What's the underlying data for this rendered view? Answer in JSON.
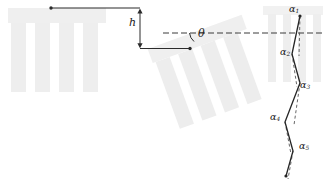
{
  "figure": {
    "width": 324,
    "height": 187,
    "background": "#ffffff",
    "colors": {
      "comb_fill": "#eeeeee",
      "comb_fill_light": "#f3f3f3",
      "line": "#2b2b2b",
      "dash": "#3a3a3a",
      "zigzag": "#262626",
      "label": "#1a1a1a"
    }
  },
  "labels": {
    "height": {
      "text": "h",
      "x": 131,
      "y": 23
    },
    "angle": {
      "text": "θ",
      "x": 198,
      "y": 34
    },
    "segments": [
      {
        "base": "α",
        "sub": "1",
        "x": 292,
        "y": 9
      },
      {
        "base": "α",
        "sub": "2",
        "x": 283,
        "y": 52
      },
      {
        "base": "α",
        "sub": "3",
        "x": 301,
        "y": 87
      },
      {
        "base": "α",
        "sub": "4",
        "x": 274,
        "y": 117
      },
      {
        "base": "α",
        "sub": "5",
        "x": 300,
        "y": 143
      }
    ]
  },
  "geometry": {
    "upright_comb": {
      "name": "upright-comb",
      "bar": {
        "x": 8,
        "y": 8,
        "w": 98,
        "h": 15
      },
      "teeth_top": 23,
      "teeth_bottom": 92,
      "teeth": [
        {
          "x": 11,
          "w": 15
        },
        {
          "x": 35,
          "w": 15
        },
        {
          "x": 59,
          "w": 15
        },
        {
          "x": 83,
          "w": 15
        }
      ]
    },
    "tilted_comb": {
      "name": "tilted-comb",
      "rotation_deg": -20,
      "pivot_x": 190,
      "pivot_y": 48,
      "bar": {
        "x": -40,
        "y": -14,
        "w": 100,
        "h": 15
      },
      "teeth_top": 1,
      "teeth_bottom": 72,
      "teeth": [
        {
          "x": -37,
          "w": 15
        },
        {
          "x": -13,
          "w": 15
        },
        {
          "x": 11,
          "w": 15
        },
        {
          "x": 35,
          "w": 15
        }
      ]
    },
    "dimension_h": {
      "name": "height-dimension",
      "top_rule": {
        "x1": 51,
        "y1": 8,
        "x2": 140,
        "y2": 8
      },
      "bottom_rule": {
        "x1": 140,
        "y1": 48.5,
        "x2": 190,
        "y2": 48.5
      },
      "arrow_x": 140,
      "arrow_top_y": 10,
      "arrow_bottom_y": 47,
      "dot": {
        "x": 51,
        "y": 8,
        "r": 1.7
      }
    },
    "angle_marker": {
      "name": "angle-theta",
      "dashed_ref": {
        "x1": 163,
        "y1": 33,
        "x2": 324,
        "y2": 33
      },
      "baseline": {
        "x1": 140,
        "y1": 48.5,
        "x2": 190,
        "y2": 48.5
      },
      "vertex": {
        "x": 190,
        "y": 48.5,
        "r": 1.7
      },
      "arc": "M 193 40 A 12 12 0 0 1 188 33"
    },
    "zigzag": {
      "name": "zigzag-polyline",
      "points": [
        [
          300,
          16
        ],
        [
          292,
          54
        ],
        [
          300,
          83
        ],
        [
          285,
          122
        ],
        [
          293,
          151
        ],
        [
          286,
          176
        ]
      ],
      "reference_dashes": [
        {
          "x1": 300,
          "y1": 16,
          "x2": 299,
          "y2": 55
        },
        {
          "x1": 292,
          "y1": 54,
          "x2": 297,
          "y2": 86
        },
        {
          "x1": 300,
          "y1": 83,
          "x2": 294,
          "y2": 124
        },
        {
          "x1": 285,
          "y1": 122,
          "x2": 291,
          "y2": 153
        },
        {
          "x1": 293,
          "y1": 151,
          "x2": 288,
          "y2": 178
        }
      ],
      "endpoint_dots": [
        {
          "x": 300,
          "y": 16,
          "r": 1.6
        },
        {
          "x": 286,
          "y": 176,
          "r": 1.6
        }
      ],
      "backdrop_stripes": [
        {
          "x": 268,
          "y": 10,
          "w": 8,
          "h": 72
        },
        {
          "x": 283,
          "y": 10,
          "w": 8,
          "h": 72
        },
        {
          "x": 298,
          "y": 10,
          "w": 8,
          "h": 72
        },
        {
          "x": 313,
          "y": 10,
          "w": 8,
          "h": 72
        }
      ],
      "backdrop_bar": {
        "x": 263,
        "y": 6,
        "w": 60,
        "h": 9
      }
    }
  }
}
